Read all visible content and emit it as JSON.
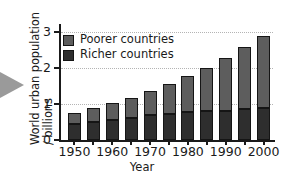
{
  "chart_data": {
    "type": "bar",
    "subtype": "stacked-bar",
    "title": "",
    "xlabel": "Year",
    "ylabel": "World urban population / billions",
    "ylabel_lines": [
      "World urban population",
      "/ billions"
    ],
    "categories": [
      1950,
      1955,
      1960,
      1965,
      1970,
      1975,
      1980,
      1985,
      1990,
      1995,
      2000
    ],
    "x_tick_labels": [
      "1950",
      "1960",
      "1970",
      "1980",
      "1990",
      "2000"
    ],
    "x_tick_values": [
      1950,
      1960,
      1970,
      1980,
      1990,
      2000
    ],
    "y_tick_labels": [
      "0",
      "1",
      "2",
      "3"
    ],
    "y_tick_values": [
      0,
      1,
      2,
      3
    ],
    "ylim": [
      0,
      3.15
    ],
    "grid": true,
    "grid_axis": "y",
    "grid_style": "dotted",
    "legend_position": "upper-left-inside",
    "series": [
      {
        "name": "Richer countries",
        "color": "#2e2e2e",
        "stack_order": "bottom",
        "values": [
          0.45,
          0.5,
          0.55,
          0.61,
          0.69,
          0.73,
          0.77,
          0.8,
          0.82,
          0.87,
          0.9
        ]
      },
      {
        "name": "Poorer countries",
        "color": "#5d5d5d",
        "stack_order": "top",
        "values": [
          0.3,
          0.39,
          0.48,
          0.57,
          0.68,
          0.82,
          1.02,
          1.22,
          1.48,
          1.71,
          2.0
        ]
      }
    ],
    "totals": [
      0.75,
      0.89,
      1.03,
      1.18,
      1.37,
      1.55,
      1.79,
      2.02,
      2.3,
      2.58,
      2.9
    ]
  },
  "legend": {
    "items": [
      {
        "label": "Poorer countries",
        "swatch_class": "poorer"
      },
      {
        "label": "Richer countries",
        "swatch_class": "richer"
      }
    ]
  },
  "decorations": {
    "arrow_marker": "right-pointing-triangle",
    "arrow_color": "#9a9a9a"
  }
}
